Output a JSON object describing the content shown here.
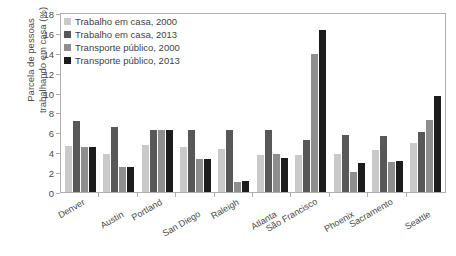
{
  "chart_data": {
    "type": "bar",
    "title": "",
    "xlabel": "",
    "ylabel": "Parcela de pessoas\ntrabalhando em casa (%)",
    "ylim": [
      0,
      18
    ],
    "yticks": [
      18,
      16,
      14,
      12,
      10,
      8,
      6,
      4,
      2,
      0
    ],
    "grid": false,
    "legend_position": "top-left",
    "categories": [
      "Denver",
      "Austin",
      "Portland",
      "San Diego",
      "Raleigh",
      "Atlanta",
      "São Francisco",
      "Phoenix",
      "Sacramento",
      "Seattle"
    ],
    "series": [
      {
        "name": "Trabalho em casa, 2000",
        "color": "#c9c9c9",
        "values": [
          4.6,
          3.8,
          4.7,
          4.5,
          4.3,
          3.7,
          3.7,
          3.8,
          4.2,
          4.9
        ]
      },
      {
        "name": "Trabalho em casa, 2013",
        "color": "#585858",
        "values": [
          7.1,
          6.5,
          6.2,
          6.2,
          6.2,
          6.2,
          5.2,
          5.7,
          5.6,
          6.0
        ]
      },
      {
        "name": "Transporte público, 2000",
        "color": "#8e8e8e",
        "values": [
          4.5,
          2.5,
          6.2,
          3.3,
          1.0,
          3.8,
          13.9,
          2.0,
          3.0,
          7.2
        ]
      },
      {
        "name": "Transporte público, 2013",
        "color": "#1c1c1c",
        "values": [
          4.5,
          2.5,
          6.2,
          3.3,
          1.1,
          3.4,
          16.3,
          2.9,
          3.1,
          9.7
        ]
      }
    ]
  },
  "legend": {
    "items": [
      {
        "label": "Trabalho em casa, 2000",
        "color": "#c9c9c9"
      },
      {
        "label": "Trabalho em casa, 2013",
        "color": "#585858"
      },
      {
        "label": "Transporte público, 2000",
        "color": "#8e8e8e"
      },
      {
        "label": "Transporte público, 2013",
        "color": "#1c1c1c"
      }
    ]
  },
  "axis": {
    "y_title": "Parcela de pessoas\ntrabalhando em casa (%)"
  }
}
